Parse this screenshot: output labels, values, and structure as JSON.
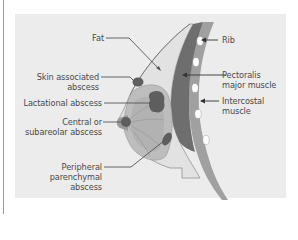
{
  "diagram": {
    "colors": {
      "background": "#ffffff",
      "panel": "#ececec",
      "fat": "#e2e2e2",
      "gland": "#bdbdbd",
      "gland_inner": "#a9a9a9",
      "abscess": "#5e5e5e",
      "pectoralis": "#6e6e6e",
      "intercostal_band": "#a0a0a0",
      "rib": "#ffffff",
      "leader_line": "#555555",
      "text": "#4a4a4a"
    },
    "labels_left": [
      {
        "id": "fat",
        "lines": [
          "Fat"
        ]
      },
      {
        "id": "skin-associated-abscess",
        "lines": [
          "Skin associated",
          "abscess"
        ]
      },
      {
        "id": "lactational-abscess",
        "lines": [
          "Lactational abscess"
        ]
      },
      {
        "id": "central-subareolar-abscess",
        "lines": [
          "Central or",
          "subareolar abscess"
        ]
      },
      {
        "id": "peripheral-parenchymal-abscess",
        "lines": [
          "Peripheral",
          "parenchymal",
          "abscess"
        ]
      }
    ],
    "labels_right": [
      {
        "id": "rib",
        "lines": [
          "Rib"
        ]
      },
      {
        "id": "pectoralis-major-muscle",
        "lines": [
          "Pectoralis",
          "major muscle"
        ]
      },
      {
        "id": "intercostal-muscle",
        "lines": [
          "Intercostal",
          "muscle"
        ]
      }
    ]
  }
}
